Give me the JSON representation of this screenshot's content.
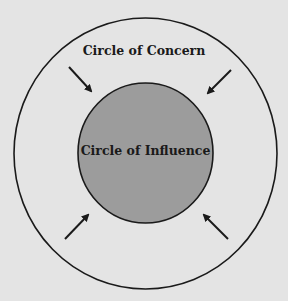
{
  "diagram": {
    "outer_circle": {
      "label": "Circle of Concern",
      "cx": 145.5,
      "cy": 153.5,
      "rx": 131.5,
      "ry": 135.5,
      "stroke": "#1a1a1a",
      "fill": "none"
    },
    "inner_circle": {
      "label": "Circle of Influence",
      "cx": 145.5,
      "cy": 153,
      "rx": 67.5,
      "ry": 70,
      "stroke": "#1a1a1a",
      "fill": "#9c9c9c"
    },
    "arrows": [
      {
        "name": "arrow-top-left",
        "direction": "inward",
        "x1": 69,
        "y1": 67,
        "x2": 93,
        "y2": 93
      },
      {
        "name": "arrow-top-right",
        "direction": "inward",
        "x1": 231,
        "y1": 70,
        "x2": 206,
        "y2": 95
      },
      {
        "name": "arrow-bottom-left",
        "direction": "inward",
        "x1": 65,
        "y1": 239,
        "x2": 90,
        "y2": 213
      },
      {
        "name": "arrow-bottom-right",
        "direction": "inward",
        "x1": 228,
        "y1": 239,
        "x2": 202,
        "y2": 213
      }
    ],
    "colors": {
      "background": "#e4e4e4",
      "line": "#1a1a1a",
      "inner_fill": "#9c9c9c"
    }
  }
}
